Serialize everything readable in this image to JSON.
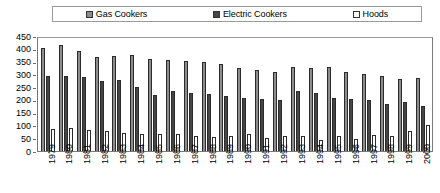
{
  "legend": {
    "position": "top",
    "entries": [
      {
        "label": "Gas Cookers",
        "color": "#8c8c8c",
        "swatch": "gas-cookers-swatch"
      },
      {
        "label": "Electric Cookers",
        "color": "#464646",
        "swatch": "electric-cookers-swatch"
      },
      {
        "label": "Hoods",
        "color": "#ffffff",
        "swatch": "hoods-swatch"
      }
    ]
  },
  "chart_data": {
    "type": "bar",
    "title": "",
    "subtitle": "",
    "xlabel": "",
    "ylabel": "",
    "ylim": [
      0,
      450
    ],
    "yticks": [
      0,
      50,
      100,
      150,
      200,
      250,
      300,
      350,
      400,
      450
    ],
    "ytick_labels": [
      "0",
      "50",
      "100",
      "150",
      "200",
      "250",
      "300",
      "350",
      "400",
      "450"
    ],
    "grid": false,
    "legend_position": "top",
    "categories": [
      "1979",
      "1980",
      "1981",
      "1982",
      "1983",
      "1984",
      "1985",
      "1986",
      "1987",
      "1988",
      "1989",
      "1990",
      "1991",
      "1992",
      "1993",
      "1994",
      "1995",
      "1996",
      "1997",
      "1998",
      "1999",
      "2000"
    ],
    "series": [
      {
        "name": "Gas Cookers",
        "color": "#8c8c8c",
        "values": [
          405,
          415,
          390,
          368,
          372,
          375,
          360,
          357,
          353,
          350,
          341,
          324,
          316,
          308,
          330,
          325,
          327,
          310,
          300,
          292,
          280,
          285
        ]
      },
      {
        "name": "Electric Cookers",
        "color": "#464646",
        "values": [
          295,
          295,
          288,
          275,
          278,
          250,
          220,
          233,
          228,
          223,
          214,
          208,
          203,
          200,
          236,
          226,
          207,
          205,
          198,
          185,
          190,
          175
        ]
      },
      {
        "name": "Hoods",
        "color": "#ffffff",
        "values": [
          85,
          92,
          82,
          80,
          72,
          68,
          65,
          67,
          58,
          54,
          58,
          66,
          52,
          58,
          60,
          42,
          58,
          48,
          62,
          60,
          80,
          100
        ]
      }
    ]
  }
}
